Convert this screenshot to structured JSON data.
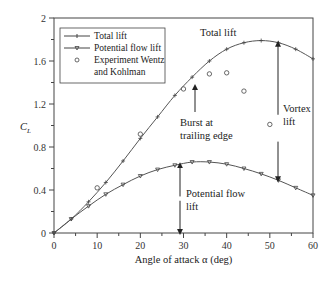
{
  "chart_data": {
    "type": "line",
    "title": "",
    "xlabel": "Angle of attack α (deg)",
    "ylabel": "C_L",
    "xlim": [
      0,
      60
    ],
    "ylim": [
      0,
      2
    ],
    "xticks": [
      0,
      10,
      20,
      30,
      40,
      50,
      60
    ],
    "yticks": [
      0,
      0.4,
      0.8,
      1.2,
      1.6,
      2
    ],
    "grid": false,
    "legend_position": "upper left",
    "series": [
      {
        "name": "Total lift",
        "marker": "plus",
        "x": [
          0,
          4,
          8,
          12,
          16,
          20,
          24,
          28,
          32,
          36,
          40,
          44,
          48,
          52,
          56,
          60
        ],
        "y": [
          0,
          0.13,
          0.29,
          0.47,
          0.67,
          0.88,
          1.08,
          1.28,
          1.45,
          1.6,
          1.71,
          1.77,
          1.79,
          1.77,
          1.71,
          1.62
        ]
      },
      {
        "name": "Potential flow lift",
        "marker": "triangle-down",
        "x": [
          0,
          4,
          8,
          12,
          16,
          20,
          24,
          28,
          32,
          36,
          40,
          44,
          48,
          52,
          56,
          60
        ],
        "y": [
          0,
          0.13,
          0.25,
          0.36,
          0.45,
          0.53,
          0.59,
          0.63,
          0.66,
          0.66,
          0.64,
          0.6,
          0.55,
          0.49,
          0.42,
          0.35
        ]
      },
      {
        "name": "Experiment Wentz and Kohlman",
        "marker": "circle-open",
        "x": [
          10,
          20,
          30,
          36,
          40,
          44,
          50
        ],
        "y": [
          0.42,
          0.92,
          1.34,
          1.48,
          1.49,
          1.32,
          1.01
        ]
      }
    ],
    "annotations": [
      {
        "text": "Total lift",
        "x": 34,
        "y": 1.8
      },
      {
        "text": "Burst at trailing edge",
        "x": 26,
        "y": 0.95,
        "arrow_to": [
          30,
          1.38
        ]
      },
      {
        "text": "Vortex lift",
        "x": 54,
        "y": 1.2,
        "arrow_from": [
          52,
          0.5
        ],
        "arrow_to": [
          52,
          1.77
        ]
      },
      {
        "text": "Potential flow lift",
        "x": 31,
        "y": 0.48,
        "arrow_from": [
          29,
          0
        ],
        "arrow_to": [
          29,
          0.64
        ]
      }
    ]
  },
  "labels": {
    "xlabel": "Angle of attack α (deg)",
    "ylabel_main": "C",
    "ylabel_sub": "L",
    "legend": [
      "Total lift",
      "Potential flow lift",
      "Experiment Wentz",
      "and  Kohlman"
    ],
    "ann_total": "Total lift",
    "ann_burst_1": "Burst at",
    "ann_burst_2": "trailing edge",
    "ann_vortex_1": "Vortex",
    "ann_vortex_2": "lift",
    "ann_pot_1": "Potential flow",
    "ann_pot_2": "lift",
    "xticks": [
      "0",
      "10",
      "20",
      "30",
      "40",
      "50",
      "60"
    ],
    "yticks": [
      "0",
      "0.4",
      "0.8",
      "1.2",
      "1.6",
      "2"
    ]
  }
}
